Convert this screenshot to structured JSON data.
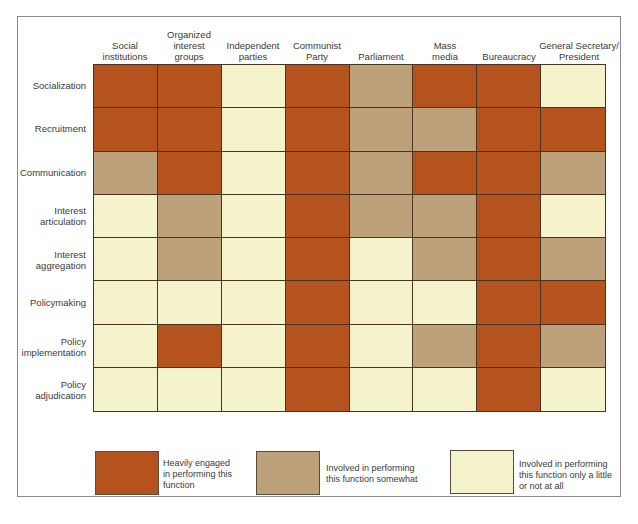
{
  "chart_data": {
    "type": "heatmap",
    "title": "",
    "columns": [
      "Social\ninstitutions",
      "Organized\ninterest\ngroups",
      "Independent\nparties",
      "Communist\nParty",
      "Parliament",
      "Mass\nmedia",
      "Bureaucracy",
      "General Secretary/\nPresident"
    ],
    "rows": [
      "Socialization",
      "Recruitment",
      "Communication",
      "Interest\narticulation",
      "Interest\naggregation",
      "Policymaking",
      "Policy\nimplementation",
      "Policy\nadjudication"
    ],
    "levels": {
      "H": "Heavily engaged in performing this function",
      "S": "Involved in performing this function somewhat",
      "L": "Involved in performing this function only a little or not at all"
    },
    "values": [
      [
        "H",
        "H",
        "L",
        "H",
        "S",
        "H",
        "H",
        "L"
      ],
      [
        "H",
        "H",
        "L",
        "H",
        "S",
        "S",
        "H",
        "H"
      ],
      [
        "S",
        "H",
        "L",
        "H",
        "S",
        "H",
        "H",
        "S"
      ],
      [
        "L",
        "S",
        "L",
        "H",
        "S",
        "S",
        "H",
        "L"
      ],
      [
        "L",
        "S",
        "L",
        "H",
        "L",
        "S",
        "H",
        "S"
      ],
      [
        "L",
        "L",
        "L",
        "H",
        "L",
        "L",
        "H",
        "H"
      ],
      [
        "L",
        "H",
        "L",
        "H",
        "L",
        "S",
        "H",
        "S"
      ],
      [
        "L",
        "L",
        "L",
        "H",
        "L",
        "L",
        "H",
        "L"
      ]
    ],
    "colors": {
      "H": "#b5531f",
      "S": "#bca17a",
      "L": "#f4f3cc"
    },
    "legend_position": "bottom"
  },
  "legend": [
    {
      "key": "H",
      "text": "Heavily engaged\nin performing this\nfunction"
    },
    {
      "key": "S",
      "text": "Involved in performing\nthis function somewhat"
    },
    {
      "key": "L",
      "text": "Involved in performing\nthis function only a little\nor not at all"
    }
  ]
}
